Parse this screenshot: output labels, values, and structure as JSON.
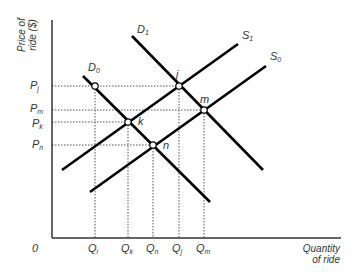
{
  "diagram": {
    "type": "supply-demand",
    "axes": {
      "y_title_line1": "Price of",
      "y_title_line2": "ride ($)",
      "x_title_line1": "Quantity",
      "x_title_line2": "of ride",
      "origin": "0"
    },
    "price_labels": [
      {
        "base": "P",
        "sub": "j",
        "y": 86
      },
      {
        "base": "P",
        "sub": "m",
        "y": 110
      },
      {
        "base": "P",
        "sub": "k",
        "y": 122
      },
      {
        "base": "P",
        "sub": "n",
        "y": 145
      }
    ],
    "quantity_labels": [
      {
        "base": "Q",
        "sub": "i",
        "x": 95
      },
      {
        "base": "Q",
        "sub": "k",
        "x": 128
      },
      {
        "base": "Q",
        "sub": "n",
        "x": 153
      },
      {
        "base": "Q",
        "sub": "j",
        "x": 179
      },
      {
        "base": "Q",
        "sub": "m",
        "x": 204
      }
    ],
    "curves": [
      {
        "name": "D0",
        "base": "D",
        "sub": "0",
        "x1": 83,
        "y1": 76,
        "x2": 210,
        "y2": 202
      },
      {
        "name": "D1",
        "base": "D",
        "sub": "1",
        "x1": 132,
        "y1": 36,
        "x2": 263,
        "y2": 170
      },
      {
        "name": "S1",
        "base": "S",
        "sub": "1",
        "x1": 62,
        "y1": 170,
        "x2": 238,
        "y2": 44
      },
      {
        "name": "S0",
        "base": "S",
        "sub": "0",
        "x1": 90,
        "y1": 192,
        "x2": 266,
        "y2": 66
      }
    ],
    "points": [
      {
        "label": "",
        "x": 95,
        "y": 86
      },
      {
        "label": "j",
        "x": 179,
        "y": 86
      },
      {
        "label": "m",
        "x": 204,
        "y": 110
      },
      {
        "label": "k",
        "x": 128,
        "y": 122
      },
      {
        "label": "n",
        "x": 153,
        "y": 145
      }
    ],
    "colors": {
      "line": "#000000",
      "axis": "#333333",
      "dashed": "#555555",
      "text": "#333333"
    }
  }
}
